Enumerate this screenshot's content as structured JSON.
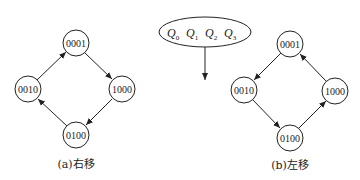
{
  "register": {
    "labels": [
      {
        "letter": "Q",
        "sub": "0"
      },
      {
        "letter": "Q",
        "sub": "1"
      },
      {
        "letter": "Q",
        "sub": "2"
      },
      {
        "letter": "Q",
        "sub": "3"
      }
    ]
  },
  "diagram_a": {
    "caption": "(a)右移",
    "nodes": {
      "top": "0001",
      "right": "1000",
      "bottom": "0100",
      "left": "0010"
    },
    "direction": "top→right→bottom→left→top"
  },
  "diagram_b": {
    "caption": "(b)左移",
    "nodes": {
      "top": "0001",
      "left": "0010",
      "bottom": "0100",
      "right": "1000"
    },
    "direction": "top→left→bottom→right→top"
  },
  "colors": {
    "stroke": "#222222",
    "background": "#ffffff"
  }
}
